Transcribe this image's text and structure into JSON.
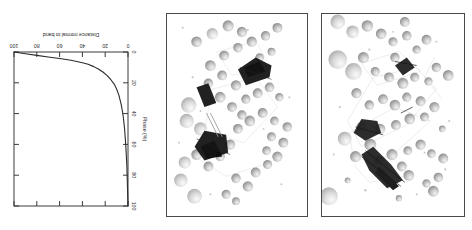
{
  "figure": {
    "orientation_deg": 180,
    "background_color": "#ffffff",
    "ink_color": "#2b2b2b",
    "panel_border_color": "#4a4a4a"
  },
  "panels": [
    {
      "id": "panel-a",
      "name": "simulation-snapshot-left",
      "kind": "atomistic-simulation-snapshot",
      "description": "Grayscale sphere packing with dark elongated defect clusters",
      "sphere_fill": "#c9c9c9",
      "cluster_color": "#1a1a1a"
    },
    {
      "id": "panel-b",
      "name": "simulation-snapshot-middle",
      "kind": "atomistic-simulation-snapshot",
      "description": "Grayscale sphere packing with two dense dark clusters and a dark bar",
      "sphere_fill": "#c9c9c9",
      "cluster_color": "#1a1a1a"
    }
  ],
  "chart_data": {
    "type": "line",
    "title": "",
    "xlabel": "Distance normal to band",
    "ylabel": "Phase (%)",
    "xlim": [
      0,
      100
    ],
    "ylim": [
      0,
      100
    ],
    "xticks": [
      0,
      20,
      40,
      60,
      80,
      100
    ],
    "xtick_labels": [
      "0",
      "20",
      "40",
      "60",
      "80",
      "100"
    ],
    "yticks": [
      0,
      20,
      40,
      60,
      80,
      100
    ],
    "ytick_labels": [
      "0",
      "20",
      "40",
      "60",
      "80",
      "100"
    ],
    "grid": false,
    "legend": false,
    "series": [
      {
        "name": "phase fraction",
        "x": [
          0,
          1,
          2,
          3,
          4,
          5,
          6,
          8,
          10,
          12,
          15,
          18,
          22,
          26,
          30,
          35,
          40,
          50,
          60,
          70,
          80,
          90,
          100
        ],
        "y": [
          100,
          74,
          60,
          50,
          43,
          38,
          34,
          28,
          24,
          21,
          18,
          15.5,
          13,
          11,
          9.5,
          8,
          7,
          5.4,
          4.2,
          3.2,
          2.2,
          1.1,
          0
        ]
      }
    ]
  }
}
